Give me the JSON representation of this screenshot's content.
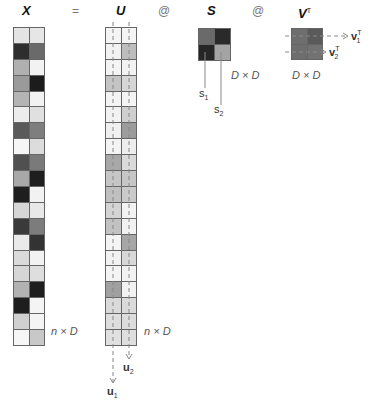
{
  "header": {
    "x_label": "X",
    "eq_label": "=",
    "u_label": "U",
    "at1_label": "@",
    "s_label": "S",
    "at2_label": "@",
    "vt_label": "V",
    "vt_sup": "T"
  },
  "dims": {
    "x_dim": "n × D",
    "u_dim": "n × D",
    "s_dim": "D × D",
    "vt_dim": "D × D"
  },
  "labels": {
    "s1": "s",
    "s1_sub": "1",
    "s2": "s",
    "s2_sub": "2",
    "u1": "u",
    "u1_sub": "1",
    "u2": "u",
    "u2_sub": "2",
    "v1": "v",
    "v1_sub": "1",
    "v1_sup": "T",
    "v2": "v",
    "v2_sub": "2",
    "v2_sup": "T"
  },
  "matrices": {
    "X": [
      [
        "#e4e4e4",
        "#e6e6e6"
      ],
      [
        "#2e2e2e",
        "#6a6a6a"
      ],
      [
        "#b0b0b0",
        "#f2f2f2"
      ],
      [
        "#9a9a9a",
        "#1c1c1c"
      ],
      [
        "#b4b4b4",
        "#f2f2f2"
      ],
      [
        "#ececec",
        "#e0e0e0"
      ],
      [
        "#5a5a5a",
        "#7e7e7e"
      ],
      [
        "#f6f6f6",
        "#dcdcdc"
      ],
      [
        "#505050",
        "#7a7a7a"
      ],
      [
        "#a8a8a8",
        "#1e1e1e"
      ],
      [
        "#1e1e1e",
        "#f2f2f2"
      ],
      [
        "#d6d6d6",
        "#e8e8e8"
      ],
      [
        "#3a3a3a",
        "#7c7c7c"
      ],
      [
        "#eaeaea",
        "#333333"
      ],
      [
        "#dadada",
        "#f2f2f2"
      ],
      [
        "#d6d6d6",
        "#dedede"
      ],
      [
        "#b2b2b2",
        "#1e1e1e"
      ],
      [
        "#1e1e1e",
        "#f4f4f4"
      ],
      [
        "#d0d0d0",
        "#f4f4f4"
      ],
      [
        "#f6f6f6",
        "#c8c8c8"
      ]
    ],
    "U": [
      [
        "#f4f4f4",
        "#f4f4f4"
      ],
      [
        "#f2f2f2",
        "#bdbdbd"
      ],
      [
        "#f4f4f4",
        "#f2f2f2"
      ],
      [
        "#c4c4c4",
        "#d6d6d6"
      ],
      [
        "#f4f4f4",
        "#f4f4f4"
      ],
      [
        "#f2f2f2",
        "#cfcfcf"
      ],
      [
        "#f0f0f0",
        "#9c9c9c"
      ],
      [
        "#f4f4f4",
        "#eeeeee"
      ],
      [
        "#a8a8a8",
        "#dadada"
      ],
      [
        "#c6c6c6",
        "#c6c6c6"
      ],
      [
        "#c0c0c0",
        "#cacaca"
      ],
      [
        "#d4d4d4",
        "#f2f2f2"
      ],
      [
        "#c2c2c2",
        "#f2f2f2"
      ],
      [
        "#f4f4f4",
        "#a6a6a6"
      ],
      [
        "#f2f2f2",
        "#d8d8d8"
      ],
      [
        "#f4f4f4",
        "#f2f2f2"
      ],
      [
        "#a0a0a0",
        "#f2f2f2"
      ],
      [
        "#dadada",
        "#dadada"
      ],
      [
        "#dedede",
        "#dcdcdc"
      ],
      [
        "#e0e0e0",
        "#dedede"
      ]
    ],
    "S": [
      [
        "#6a6a6a",
        "#2a2a2a"
      ],
      [
        "#262626",
        "#a4a4a4"
      ]
    ],
    "VT": [
      [
        "#6e6e6e",
        "#5a5a5a"
      ],
      [
        "#6e6e6e",
        "#727272"
      ]
    ]
  }
}
